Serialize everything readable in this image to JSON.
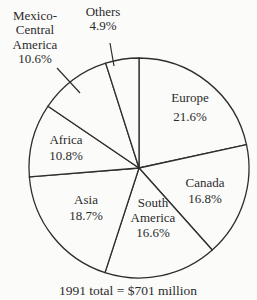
{
  "chart_data": {
    "type": "pie",
    "title": "",
    "caption": "1991 total = $701 million",
    "start_angle_deg": 0,
    "direction": "clockwise",
    "slices": [
      {
        "label": "Europe",
        "value": 21.6,
        "display": "21.6%",
        "label_lines": [
          "Europe",
          "21.6%"
        ],
        "label_pos": "inside"
      },
      {
        "label": "Canada",
        "value": 16.8,
        "display": "16.8%",
        "label_lines": [
          "Canada",
          "16.8%"
        ],
        "label_pos": "inside"
      },
      {
        "label": "South America",
        "value": 16.6,
        "display": "16.6%",
        "label_lines": [
          "South",
          "America",
          "16.6%"
        ],
        "label_pos": "inside"
      },
      {
        "label": "Asia",
        "value": 18.7,
        "display": "18.7%",
        "label_lines": [
          "Asia",
          "18.7%"
        ],
        "label_pos": "inside"
      },
      {
        "label": "Africa",
        "value": 10.8,
        "display": "10.8%",
        "label_lines": [
          "Africa",
          "10.8%"
        ],
        "label_pos": "inside"
      },
      {
        "label": "Mexico-Central America",
        "value": 10.6,
        "display": "10.6%",
        "label_lines": [
          "Mexico-",
          "Central",
          "America",
          "10.6%"
        ],
        "label_pos": "outside"
      },
      {
        "label": "Others",
        "value": 4.9,
        "display": "4.9%",
        "label_lines": [
          "Others",
          "4.9%"
        ],
        "label_pos": "outside"
      }
    ],
    "total": "$701 million",
    "year": "1991",
    "legend": "none",
    "grid": false
  },
  "style": {
    "stroke_color": "#2e2e2e",
    "fill_color": "#fbfbfa",
    "text_color": "#2b2b2b"
  }
}
